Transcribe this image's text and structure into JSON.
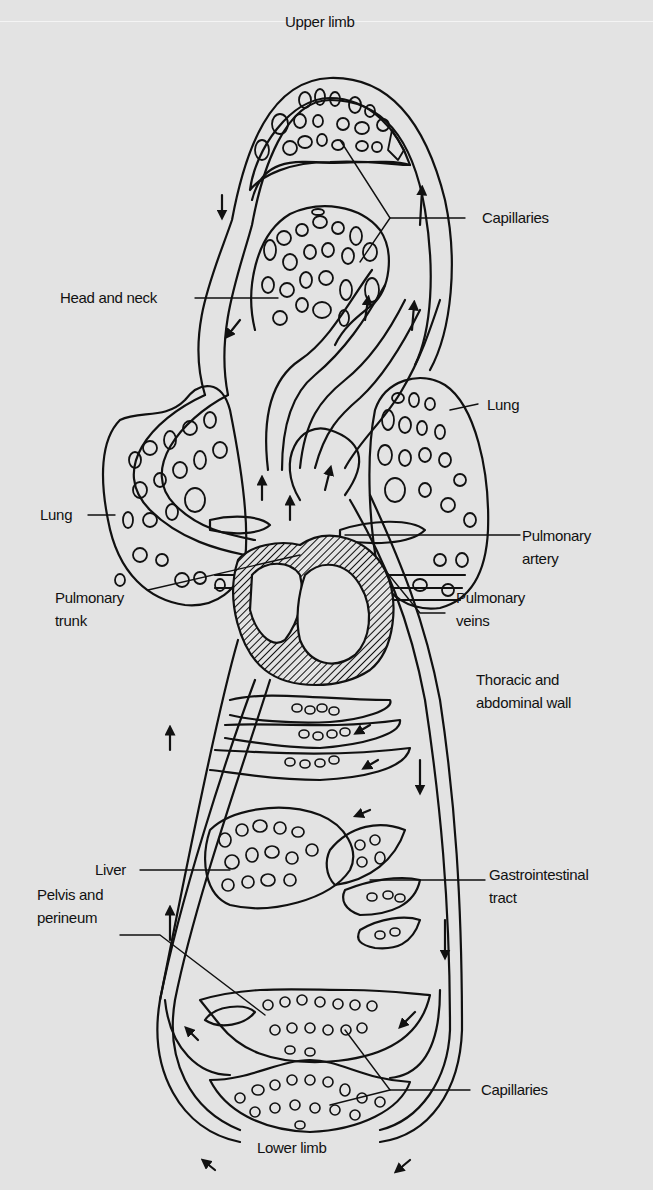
{
  "figure": {
    "background_color": "#e3e3e3",
    "ink_color": "#111111",
    "labels": {
      "upper_limb": "Upper limb",
      "capillaries_top": "Capillaries",
      "head_and_neck": "Head and neck",
      "lung_right": "Lung",
      "lung_left": "Lung",
      "pulmonary_artery_line1": "Pulmonary",
      "pulmonary_artery_line2": "artery",
      "pulmonary_trunk_line1": "Pulmonary",
      "pulmonary_trunk_line2": "trunk",
      "pulmonary_veins_line1": "Pulmonary",
      "pulmonary_veins_line2": "veins",
      "thoracic_line1": "Thoracic and",
      "thoracic_line2": "abdominal wall",
      "liver": "Liver",
      "gi_line1": "Gastrointestinal",
      "gi_line2": "tract",
      "pelvis_line1": "Pelvis and",
      "pelvis_line2": "perineum",
      "capillaries_bottom": "Capillaries",
      "lower_limb": "Lower limb"
    },
    "arrow_legend": {
      "open_arrow": "deoxygenated (venous) flow",
      "filled_arrow": "oxygenated (arterial) flow"
    }
  }
}
